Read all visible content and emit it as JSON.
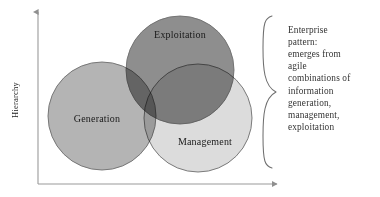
{
  "figure": {
    "background_color": "#ffffff",
    "axes": {
      "y_label": "Hierarchy",
      "axis_color": "#9a9a9a",
      "y_axis": {
        "x": 38,
        "top": 12,
        "bottom": 184
      },
      "x_axis": {
        "y": 184,
        "left": 38,
        "right": 277
      }
    },
    "venn": {
      "blend_mode": "multiply",
      "stroke_color": "#6e6e6e",
      "circles": [
        {
          "key": "exploitation",
          "label": "Exploitation",
          "fill": "#8e8e8e",
          "cx": 180,
          "cy": 70,
          "r": 54,
          "label_x": 180,
          "label_y": 38
        },
        {
          "key": "generation",
          "label": "Generation",
          "fill": "#b4b4b4",
          "cx": 102,
          "cy": 116,
          "r": 54,
          "label_x": 97,
          "label_y": 122
        },
        {
          "key": "management",
          "label": "Management",
          "fill": "#dcdcdc",
          "cx": 198,
          "cy": 118,
          "r": 54,
          "label_x": 205,
          "label_y": 145
        }
      ]
    },
    "brace": {
      "color": "#6f6f6f",
      "top": 16,
      "bottom": 168,
      "tip_x": 276,
      "tip_y": 92,
      "spine_x": 263
    },
    "annotation": {
      "x": 288,
      "start_y": 33,
      "line_height": 12.1,
      "lines": [
        "Enterprise",
        "pattern:",
        "emerges from",
        "agile",
        "combinations of",
        "information",
        "generation,",
        "management,",
        "exploitation"
      ]
    }
  }
}
